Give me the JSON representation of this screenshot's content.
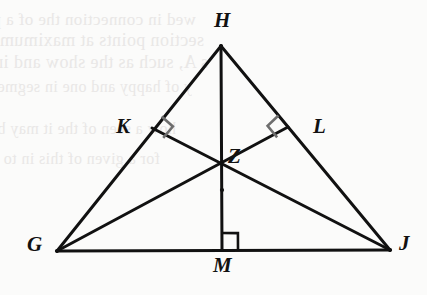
{
  "figure": {
    "type": "geometry-diagram",
    "shape": "triangle",
    "canvas": {
      "width": 427,
      "height": 295
    },
    "background_color": "#fbfbfa",
    "stroke_color": "#111111",
    "right_angle_color": "#666666",
    "right_angle_color_dark": "#111111"
  },
  "vertices": [
    {
      "name": "H",
      "label": "H",
      "x": 221,
      "y": 46,
      "label_x": 214,
      "label_y": 10,
      "role": "apex"
    },
    {
      "name": "K",
      "label": "K",
      "x": 152,
      "y": 128,
      "label_x": 116,
      "label_y": 116,
      "role": "foot-on-GH"
    },
    {
      "name": "L",
      "label": "L",
      "x": 288,
      "y": 127,
      "label_x": 313,
      "label_y": 116,
      "role": "foot-on-HJ"
    },
    {
      "name": "Z",
      "label": "Z",
      "x": 222,
      "y": 190,
      "label_x": 228,
      "label_y": 146,
      "role": "intersection-point"
    },
    {
      "name": "G",
      "label": "G",
      "x": 57,
      "y": 251,
      "label_x": 27,
      "label_y": 234,
      "role": "base-left"
    },
    {
      "name": "M",
      "label": "M",
      "x": 222,
      "y": 249,
      "label_x": 213,
      "label_y": 255,
      "role": "foot-on-GJ"
    },
    {
      "name": "J",
      "label": "J",
      "x": 390,
      "y": 250,
      "label_x": 399,
      "label_y": 233,
      "role": "base-right"
    }
  ],
  "segments": [
    {
      "name": "segment-GH",
      "from": "G",
      "to": "H",
      "x1": 57,
      "y1": 251,
      "x2": 221,
      "y2": 46,
      "width": 3
    },
    {
      "name": "segment-HJ",
      "from": "H",
      "to": "J",
      "x1": 221,
      "y1": 46,
      "x2": 390,
      "y2": 250,
      "width": 3
    },
    {
      "name": "segment-GJ",
      "from": "G",
      "to": "J",
      "x1": 57,
      "y1": 251,
      "x2": 390,
      "y2": 250,
      "width": 3
    },
    {
      "name": "segment-HM",
      "from": "H",
      "to": "M",
      "x1": 221,
      "y1": 46,
      "x2": 222,
      "y2": 250,
      "width": 3
    },
    {
      "name": "segment-GL",
      "from": "G",
      "to": "L",
      "x1": 57,
      "y1": 251,
      "x2": 288,
      "y2": 127,
      "width": 3
    },
    {
      "name": "segment-JK",
      "from": "J",
      "to": "K",
      "x1": 390,
      "y1": 250,
      "x2": 152,
      "y2": 128,
      "width": 3
    }
  ],
  "right_angles": [
    {
      "name": "right-angle-K",
      "at": "K",
      "size": 15,
      "color": "#6e6e6e",
      "note": "GL perpendicular to GH at K"
    },
    {
      "name": "right-angle-L",
      "at": "L",
      "size": 15,
      "color": "#6e6e6e",
      "note": "JK perpendicular to HJ at L"
    },
    {
      "name": "right-angle-M",
      "at": "M",
      "size": 16,
      "color": "#111111",
      "note": "HM perpendicular to GJ at M"
    }
  ],
  "bleed_through": {
    "description": "faint mirrored show-through text from the reverse side of the page",
    "lines": [
      {
        "text": "wed in connection the  of a  perimeter",
        "x": 196,
        "y": 10,
        "size": 17
      },
      {
        "text": "section points at maximum angle G, m",
        "x": 204,
        "y": 30,
        "size": 18
      },
      {
        "text": "s A, such as the  show and included",
        "x": 208,
        "y": 52,
        "size": 18
      },
      {
        "text": "y  of  happy  and  one  in  segment  for",
        "x": 192,
        "y": 78,
        "size": 16
      },
      {
        "text": "how  a  seen  of  the  it  may  be  angle",
        "x": 176,
        "y": 120,
        "size": 16
      },
      {
        "text": "for  a  given  of  this  in  to  one",
        "x": 160,
        "y": 150,
        "size": 16
      }
    ]
  }
}
